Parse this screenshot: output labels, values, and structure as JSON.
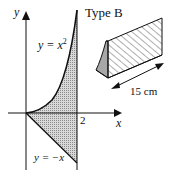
{
  "diagram": {
    "title": "Type B",
    "axes": {
      "x_label": "x",
      "y_label": "y",
      "x_tick": "2"
    },
    "curves": [
      {
        "name": "upper",
        "equation": "y = x",
        "exponent": "2"
      },
      {
        "name": "lower",
        "equation": "y = −x"
      }
    ],
    "solid": {
      "dimension_label": "15 cm"
    },
    "colors": {
      "ink": "#111111",
      "shade": "#bdbdbd"
    }
  }
}
